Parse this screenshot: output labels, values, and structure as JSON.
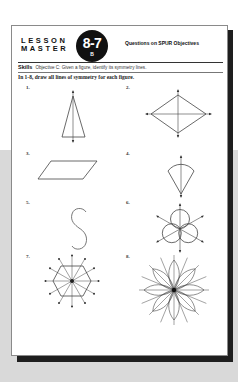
{
  "header": {
    "lesson_line1": "LESSON",
    "lesson_line2": "MASTER",
    "badge_number": "8-7",
    "badge_sub": "B",
    "subtitle": "Questions on SPUR Objectives"
  },
  "skills": {
    "label": "Skills",
    "objective": "Objective C: Given a figure, identify its symmetry lines."
  },
  "instructions": "In 1-8, draw all lines of symmetry for each figure.",
  "figures": [
    {
      "number": "1.",
      "shape": "isosceles-triangle",
      "symmetry_lines": 1
    },
    {
      "number": "2.",
      "shape": "rhombus",
      "symmetry_lines": 2
    },
    {
      "number": "3.",
      "shape": "parallelogram",
      "symmetry_lines": 0
    },
    {
      "number": "4.",
      "shape": "sector",
      "symmetry_lines": 1
    },
    {
      "number": "5.",
      "shape": "letter-s",
      "symmetry_lines": 0
    },
    {
      "number": "6.",
      "shape": "three-circles",
      "symmetry_lines": 3
    },
    {
      "number": "7.",
      "shape": "regular-hexagon",
      "symmetry_lines": 6
    },
    {
      "number": "8.",
      "shape": "eight-petal-flower",
      "symmetry_lines": 8
    }
  ],
  "colors": {
    "ink": "#111111",
    "background_band": "#d9d9d9",
    "shadow": "#1e1e1e"
  }
}
